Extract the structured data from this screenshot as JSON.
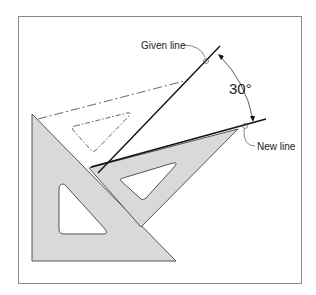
{
  "figure": {
    "labels": {
      "given_line": "Given line",
      "new_line": "New line",
      "angle": "30°"
    },
    "colors": {
      "frame": "#8a8a8a",
      "triangle_fill": "#d9d9d9",
      "triangle_stroke": "#555555",
      "line": "#111111",
      "dashed": "#555555",
      "background": "#ffffff"
    },
    "angle_degrees": 30
  }
}
